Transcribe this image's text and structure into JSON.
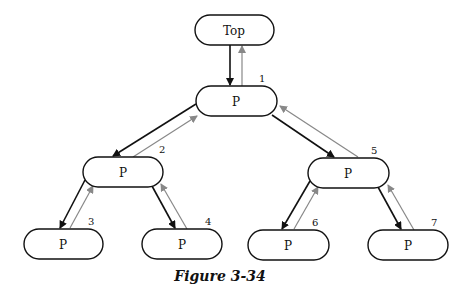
{
  "figure": {
    "caption": "Figure 3-34",
    "colors": {
      "down_arrow": "#111111",
      "up_arrow": "#888888",
      "node_stroke": "#111111"
    },
    "nodes": [
      {
        "id": "top",
        "label": "Top",
        "number": ""
      },
      {
        "id": "n1",
        "label": "P",
        "number": "1"
      },
      {
        "id": "n2",
        "label": "P",
        "number": "2"
      },
      {
        "id": "n3",
        "label": "P",
        "number": "3"
      },
      {
        "id": "n4",
        "label": "P",
        "number": "4"
      },
      {
        "id": "n5",
        "label": "P",
        "number": "5"
      },
      {
        "id": "n6",
        "label": "P",
        "number": "6"
      },
      {
        "id": "n7",
        "label": "P",
        "number": "7"
      }
    ],
    "edges": [
      {
        "from": "top",
        "to": "n1"
      },
      {
        "from": "n1",
        "to": "n2"
      },
      {
        "from": "n1",
        "to": "n5"
      },
      {
        "from": "n2",
        "to": "n3"
      },
      {
        "from": "n2",
        "to": "n4"
      },
      {
        "from": "n5",
        "to": "n6"
      },
      {
        "from": "n5",
        "to": "n7"
      }
    ]
  }
}
